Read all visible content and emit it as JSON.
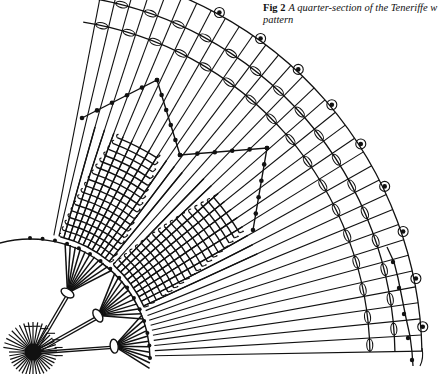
{
  "caption": {
    "label": "Fig 2",
    "line1": "A quarter-section of the Teneriffe w",
    "line2": "pattern"
  },
  "colors": {
    "ink": "#111111",
    "paper": "#ffffff"
  },
  "figure": {
    "center": [
      30,
      358
    ],
    "spoke_angles_deg": {
      "start": -79,
      "end": -1,
      "count": 34
    },
    "spoke_inner_r": 125,
    "spoke_outer_r": 392,
    "rings": [
      {
        "r": 340,
        "type": "ovals"
      },
      {
        "r": 365,
        "type": "ovals"
      },
      {
        "r": 392,
        "type": "scallops"
      }
    ],
    "outer_tail": {
      "start_deg": -1,
      "end_deg": 1.5,
      "dots": 5
    },
    "inner_arc_r": 120,
    "woven_blocks": [
      {
        "from_deg": -76,
        "to_deg": -50,
        "r_in": 125,
        "r_out": 240
      },
      {
        "from_deg": -48,
        "to_deg": -24,
        "r_in": 125,
        "r_out": 250
      }
    ],
    "outline_paths": [
      [
        [
          82,
          118
        ],
        [
          157,
          80
        ],
        [
          180,
          155
        ],
        [
          267,
          148
        ],
        [
          253,
          230
        ]
      ]
    ],
    "rosettes": [
      {
        "angle_deg": -60,
        "r": 75
      },
      {
        "angle_deg": -32,
        "r": 80
      },
      {
        "angle_deg": -8,
        "r": 85
      }
    ],
    "hub": {
      "center": [
        33,
        352
      ],
      "r": 14
    }
  }
}
